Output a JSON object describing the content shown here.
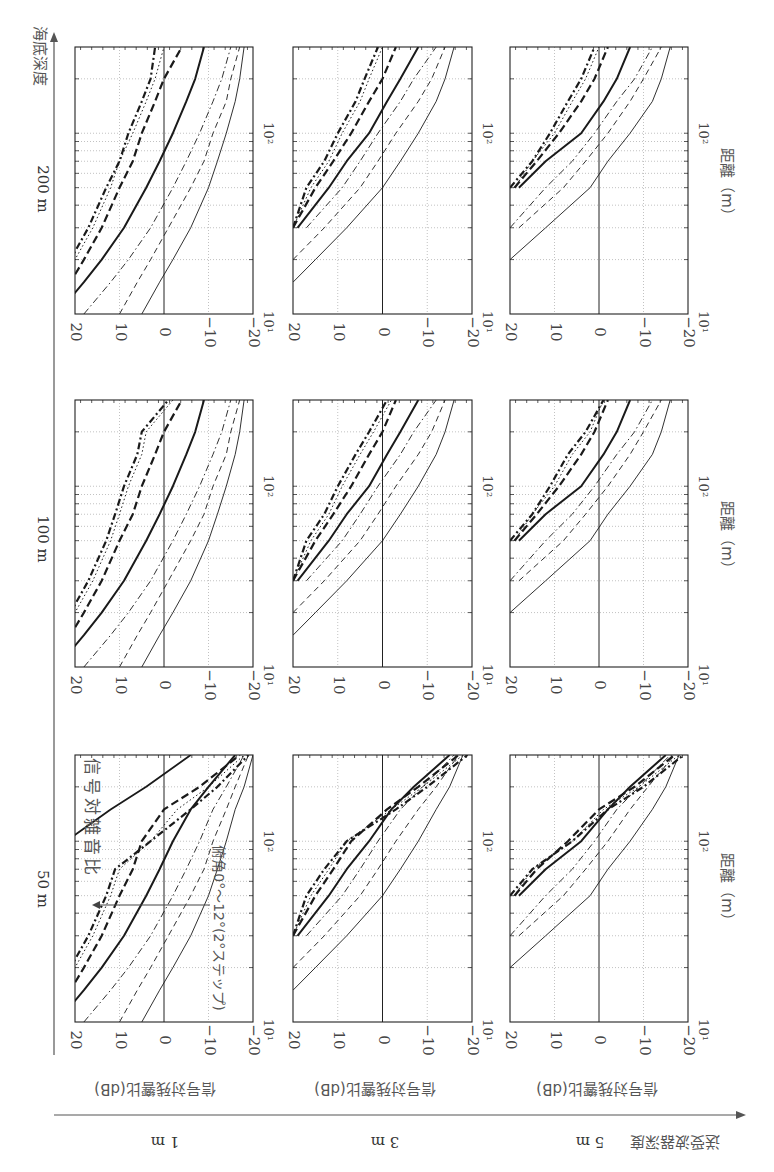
{
  "figure": {
    "orientation": "rotated 90 degrees clockwise",
    "seabed_axis_label": "海底深度",
    "transducer_axis_label": "送受波器深度",
    "seabed_depths": [
      "200 m",
      "100 m",
      "50 m"
    ],
    "transducer_depths": [
      "1 m",
      "3 m",
      "5 m"
    ],
    "y_axis_label": "信号対残響比(dB)",
    "x_axis_label": "距離（m）",
    "annotation_snr": "信号対雑音比",
    "annotation_angles": "俯角0°～12°(2°ステップ)",
    "y_ticks": [
      "20",
      "10",
      "0",
      "−10",
      "−20"
    ],
    "x_ticks": [
      "10¹",
      "10²"
    ]
  },
  "chart_data": {
    "type": "line",
    "xlabel": "距離（m）",
    "ylabel": "信号対残響比(dB)",
    "xscale": "log",
    "xlim": [
      10,
      300
    ],
    "ylim": [
      -20,
      20
    ],
    "grid": true,
    "legend": "depression angle 0°,2°,4°,6°,8°,10°,12° (line styles: thin solid, thin dashed, thin dash-dot, thick solid, thick dashed, thin dotted, thick dash-dot)",
    "angles_deg": [
      0,
      2,
      4,
      6,
      8,
      10,
      12
    ],
    "x": [
      10,
      15,
      20,
      30,
      50,
      70,
      100,
      150,
      200,
      300
    ],
    "panels": [
      {
        "seabed": "200 m",
        "transducer": "1 m",
        "series": [
          {
            "name": "0°",
            "values": [
              5,
              1,
              -2,
              -6,
              -10,
              -12,
              -14,
              -16,
              -17,
              -18
            ]
          },
          {
            "name": "2°",
            "values": [
              10,
              6,
              3,
              -1,
              -6,
              -9,
              -11,
              -14,
              -15,
              -17
            ]
          },
          {
            "name": "4°",
            "values": [
              18,
              12,
              8,
              3,
              -2,
              -5,
              -8,
              -11,
              -13,
              -15
            ]
          },
          {
            "name": "6°",
            "values": [
              24,
              18,
              14,
              9,
              4,
              1,
              -2,
              -5,
              -7,
              -9
            ]
          },
          {
            "name": "8°",
            "values": [
              26,
              21,
              18,
              14,
              10,
              7,
              5,
              2,
              0,
              -4
            ]
          },
          {
            "name": "10°",
            "values": [
              28,
              23,
              20,
              16,
              12,
              10,
              7,
              4,
              2,
              0
            ]
          },
          {
            "name": "12°",
            "values": [
              28,
              24,
              21,
              17,
              13,
              10,
              8,
              5,
              3,
              2
            ]
          }
        ]
      },
      {
        "seabed": "200 m",
        "transducer": "3 m",
        "series": [
          {
            "name": "0°",
            "values": [
              null,
              20,
              15,
              8,
              0,
              -4,
              -8,
              -12,
              -14,
              -16
            ]
          },
          {
            "name": "2°",
            "values": [
              null,
              null,
              20,
              13,
              5,
              1,
              -3,
              -8,
              -11,
              -14
            ]
          },
          {
            "name": "4°",
            "values": [
              null,
              null,
              null,
              17,
              9,
              5,
              1,
              -4,
              -7,
              -12
            ]
          },
          {
            "name": "6°",
            "values": [
              null,
              null,
              null,
              19,
              12,
              8,
              3,
              -1,
              -4,
              -8
            ]
          },
          {
            "name": "8°",
            "values": [
              null,
              null,
              null,
              20,
              15,
              11,
              7,
              3,
              0,
              -3
            ]
          },
          {
            "name": "10°",
            "values": [
              null,
              null,
              null,
              20,
              16,
              12,
              9,
              5,
              3,
              0
            ]
          },
          {
            "name": "12°",
            "values": [
              null,
              null,
              null,
              20,
              17,
              13,
              10,
              6,
              4,
              1
            ]
          }
        ]
      },
      {
        "seabed": "200 m",
        "transducer": "5 m",
        "series": [
          {
            "name": "0°",
            "values": [
              null,
              null,
              20,
              12,
              2,
              -2,
              -7,
              -12,
              -14,
              -16
            ]
          },
          {
            "name": "2°",
            "values": [
              null,
              null,
              null,
              18,
              8,
              3,
              -2,
              -7,
              -10,
              -14
            ]
          },
          {
            "name": "4°",
            "values": [
              null,
              null,
              null,
              20,
              12,
              6,
              1,
              -4,
              -8,
              -12
            ]
          },
          {
            "name": "6°",
            "values": [
              null,
              null,
              null,
              null,
              18,
              12,
              4,
              -1,
              -4,
              -7
            ]
          },
          {
            "name": "8°",
            "values": [
              null,
              null,
              null,
              null,
              19,
              14,
              9,
              4,
              1,
              -2
            ]
          },
          {
            "name": "10°",
            "values": [
              null,
              null,
              null,
              null,
              19,
              15,
              10,
              6,
              3,
              0
            ]
          },
          {
            "name": "12°",
            "values": [
              null,
              null,
              null,
              null,
              20,
              15,
              11,
              7,
              4,
              1
            ]
          }
        ]
      },
      {
        "seabed": "100 m",
        "transducer": "1 m",
        "series": [
          {
            "name": "0°",
            "values": [
              5,
              1,
              -2,
              -6,
              -10,
              -12,
              -14,
              -16,
              -17,
              -18
            ]
          },
          {
            "name": "2°",
            "values": [
              10,
              6,
              3,
              -1,
              -6,
              -9,
              -11,
              -14,
              -15,
              -17
            ]
          },
          {
            "name": "4°",
            "values": [
              18,
              12,
              8,
              3,
              -2,
              -5,
              -8,
              -11,
              -13,
              -15
            ]
          },
          {
            "name": "6°",
            "values": [
              24,
              18,
              14,
              9,
              4,
              1,
              -2,
              -5,
              -7,
              -9
            ]
          },
          {
            "name": "8°",
            "values": [
              26,
              21,
              18,
              14,
              10,
              7,
              5,
              2,
              0,
              -4
            ]
          },
          {
            "name": "10°",
            "values": [
              28,
              23,
              20,
              16,
              12,
              10,
              8,
              5,
              4,
              -2
            ]
          },
          {
            "name": "12°",
            "values": [
              28,
              24,
              21,
              17,
              13,
              11,
              9,
              6,
              5,
              -1
            ]
          }
        ]
      },
      {
        "seabed": "100 m",
        "transducer": "3 m",
        "series": [
          {
            "name": "0°",
            "values": [
              null,
              20,
              15,
              8,
              0,
              -4,
              -8,
              -12,
              -14,
              -16
            ]
          },
          {
            "name": "2°",
            "values": [
              null,
              null,
              20,
              13,
              5,
              1,
              -3,
              -8,
              -11,
              -14
            ]
          },
          {
            "name": "4°",
            "values": [
              null,
              null,
              null,
              17,
              9,
              5,
              1,
              -4,
              -7,
              -12
            ]
          },
          {
            "name": "6°",
            "values": [
              null,
              null,
              null,
              19,
              12,
              8,
              3,
              -1,
              -4,
              -8
            ]
          },
          {
            "name": "8°",
            "values": [
              null,
              null,
              null,
              20,
              15,
              11,
              7,
              3,
              0,
              -3
            ]
          },
          {
            "name": "10°",
            "values": [
              null,
              null,
              null,
              20,
              16,
              12,
              9,
              5,
              2,
              -2
            ]
          },
          {
            "name": "12°",
            "values": [
              null,
              null,
              null,
              20,
              17,
              13,
              10,
              6,
              3,
              -1
            ]
          }
        ]
      },
      {
        "seabed": "100 m",
        "transducer": "5 m",
        "series": [
          {
            "name": "0°",
            "values": [
              null,
              null,
              20,
              12,
              2,
              -2,
              -7,
              -12,
              -14,
              -16
            ]
          },
          {
            "name": "2°",
            "values": [
              null,
              null,
              null,
              18,
              8,
              3,
              -2,
              -7,
              -10,
              -14
            ]
          },
          {
            "name": "4°",
            "values": [
              null,
              null,
              null,
              20,
              12,
              6,
              1,
              -4,
              -8,
              -12
            ]
          },
          {
            "name": "6°",
            "values": [
              null,
              null,
              null,
              null,
              18,
              12,
              4,
              -1,
              -4,
              -7
            ]
          },
          {
            "name": "8°",
            "values": [
              null,
              null,
              null,
              null,
              19,
              14,
              9,
              4,
              1,
              -2
            ]
          },
          {
            "name": "10°",
            "values": [
              null,
              null,
              null,
              null,
              19,
              15,
              10,
              6,
              2,
              -1
            ]
          },
          {
            "name": "12°",
            "values": [
              null,
              null,
              null,
              null,
              20,
              15,
              11,
              7,
              3,
              -1
            ]
          }
        ]
      },
      {
        "seabed": "50 m",
        "transducer": "1 m",
        "series": [
          {
            "name": "0°",
            "values": [
              5,
              1,
              -2,
              -6,
              -10,
              -12,
              -14,
              -16,
              -18,
              -20
            ]
          },
          {
            "name": "2°",
            "values": [
              10,
              6,
              3,
              -1,
              -6,
              -9,
              -11,
              -14,
              -16,
              -19
            ]
          },
          {
            "name": "4°",
            "values": [
              18,
              12,
              8,
              3,
              -2,
              -5,
              -8,
              -11,
              -14,
              -18
            ]
          },
          {
            "name": "6°",
            "values": [
              24,
              18,
              14,
              9,
              4,
              1,
              -2,
              -6,
              -10,
              -16
            ]
          },
          {
            "name": "8°",
            "values": [
              26,
              21,
              18,
              14,
              10,
              7,
              5,
              0,
              -8,
              -17
            ]
          },
          {
            "name": "10°",
            "values": [
              28,
              23,
              20,
              16,
              12,
              10,
              3,
              -3,
              -10,
              -18
            ]
          },
          {
            "name": "12°",
            "values": [
              28,
              24,
              21,
              17,
              13,
              11,
              3,
              -6,
              -12,
              -19
            ]
          },
          {
            "name": "信号対雑音比",
            "values": [
              null,
              null,
              null,
              null,
              null,
              30,
              22,
              12,
              4,
              -6
            ]
          }
        ]
      },
      {
        "seabed": "50 m",
        "transducer": "3 m",
        "series": [
          {
            "name": "0°",
            "values": [
              null,
              20,
              15,
              8,
              0,
              -4,
              -8,
              -12,
              -15,
              -18
            ]
          },
          {
            "name": "2°",
            "values": [
              null,
              null,
              20,
              13,
              5,
              1,
              -3,
              -8,
              -12,
              -17
            ]
          },
          {
            "name": "4°",
            "values": [
              null,
              null,
              null,
              17,
              9,
              5,
              1,
              -4,
              -9,
              -16
            ]
          },
          {
            "name": "6°",
            "values": [
              null,
              null,
              null,
              19,
              12,
              8,
              3,
              -2,
              -7,
              -15
            ]
          },
          {
            "name": "8°",
            "values": [
              null,
              null,
              null,
              20,
              15,
              11,
              7,
              -1,
              -8,
              -17
            ]
          },
          {
            "name": "10°",
            "values": [
              null,
              null,
              null,
              20,
              16,
              12,
              8,
              -2,
              -9,
              -18
            ]
          },
          {
            "name": "12°",
            "values": [
              null,
              null,
              null,
              20,
              17,
              13,
              8,
              -3,
              -10,
              -19
            ]
          }
        ]
      },
      {
        "seabed": "50 m",
        "transducer": "5 m",
        "series": [
          {
            "name": "0°",
            "values": [
              null,
              null,
              20,
              12,
              2,
              -2,
              -7,
              -12,
              -15,
              -18
            ]
          },
          {
            "name": "2°",
            "values": [
              null,
              null,
              null,
              18,
              8,
              3,
              -2,
              -7,
              -11,
              -17
            ]
          },
          {
            "name": "4°",
            "values": [
              null,
              null,
              null,
              20,
              12,
              6,
              1,
              -4,
              -9,
              -16
            ]
          },
          {
            "name": "6°",
            "values": [
              null,
              null,
              null,
              null,
              18,
              12,
              4,
              -2,
              -7,
              -15
            ]
          },
          {
            "name": "8°",
            "values": [
              null,
              null,
              null,
              null,
              19,
              14,
              7,
              0,
              -8,
              -17
            ]
          },
          {
            "name": "10°",
            "values": [
              null,
              null,
              null,
              null,
              19,
              15,
              6,
              -1,
              -9,
              -18
            ]
          },
          {
            "name": "12°",
            "values": [
              null,
              null,
              null,
              null,
              20,
              15,
              6,
              -2,
              -10,
              -19
            ]
          }
        ]
      }
    ]
  }
}
